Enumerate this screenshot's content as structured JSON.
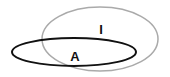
{
  "diagram": {
    "type": "venn",
    "sets": [
      {
        "label": "I",
        "stroke": "#aaaaaa",
        "cx": 100,
        "cy": 39,
        "rx": 58,
        "ry": 32,
        "stroke_width": 1.5
      },
      {
        "label": "A",
        "stroke": "#111111",
        "cx": 74,
        "cy": 52,
        "rx": 62,
        "ry": 14,
        "stroke_width": 2
      }
    ],
    "labels": {
      "I": {
        "text": "I",
        "x": 101,
        "y": 34
      },
      "A": {
        "text": "A",
        "x": 75,
        "y": 61
      }
    }
  }
}
